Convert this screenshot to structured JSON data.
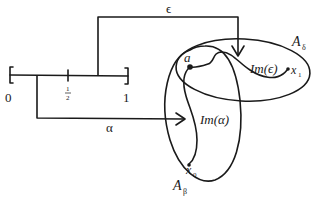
{
  "diagram": {
    "interval": {
      "left_label": "0",
      "right_label": "1",
      "mid_label_num": "1",
      "mid_label_den": "2"
    },
    "maps": {
      "epsilon_label": "ϵ",
      "alpha_label": "α"
    },
    "sets": {
      "a_delta_label": "A",
      "a_delta_sub": "δ",
      "a_beta_label": "A",
      "a_beta_sub": "β"
    },
    "images": {
      "im_epsilon": "Im(ϵ)",
      "im_alpha": "Im(α)"
    },
    "points": {
      "a": "a",
      "x1": "x",
      "x1_sub": "1",
      "x0": "x",
      "x0_sub": "0"
    },
    "colors": {
      "stroke": "#1a1a1a",
      "background": "#ffffff"
    }
  }
}
